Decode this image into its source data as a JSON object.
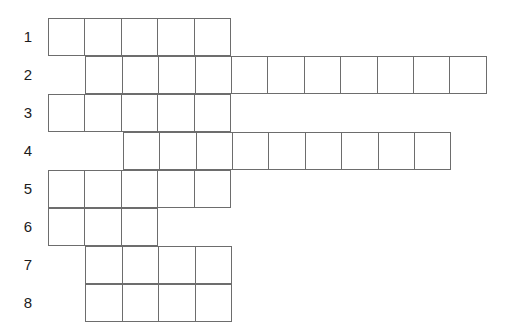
{
  "puzzle": {
    "type": "crossword-skeleton-grid",
    "columns_total": 12,
    "rows_total": 8,
    "cell_width": 37.4,
    "cell_height": 38,
    "origin_x": 48,
    "origin_y": 18,
    "border_color": "#6d6d6d",
    "cell_fill": "#ffffff",
    "label_color": "#1c1c1c",
    "background": "#ffffff",
    "rows": [
      {
        "label": "1",
        "start_col": 1,
        "length": 5
      },
      {
        "label": "2",
        "start_col": 2,
        "length": 11
      },
      {
        "label": "3",
        "start_col": 1,
        "length": 5
      },
      {
        "label": "4",
        "start_col": 3,
        "length": 9
      },
      {
        "label": "5",
        "start_col": 1,
        "length": 5
      },
      {
        "label": "6",
        "start_col": 1,
        "length": 3
      },
      {
        "label": "7",
        "start_col": 2,
        "length": 4
      },
      {
        "label": "8",
        "start_col": 2,
        "length": 4
      }
    ]
  }
}
